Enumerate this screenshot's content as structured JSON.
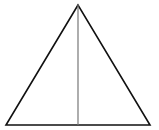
{
  "diagram": {
    "type": "isosceles-triangle-with-altitude",
    "background": "#ffffff",
    "triangle": {
      "apex": [
        78,
        5
      ],
      "base_left": [
        6,
        125
      ],
      "base_right": [
        150,
        125
      ],
      "stroke": "#111111",
      "stroke_width": 1.6
    },
    "altitude": {
      "from": [
        78,
        5
      ],
      "to": [
        78,
        125
      ],
      "stroke": "#777777",
      "stroke_width": 1.2
    }
  }
}
